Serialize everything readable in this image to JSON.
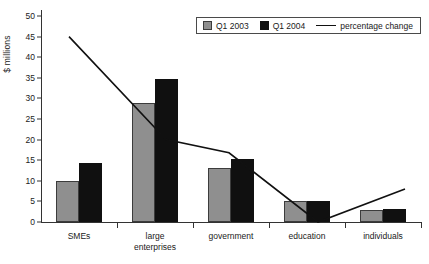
{
  "chart_data": {
    "type": "bar",
    "title": "",
    "xlabel": "",
    "ylabel": "$ millions",
    "ylim": [
      0,
      50
    ],
    "yticks": [
      0,
      5,
      10,
      15,
      20,
      25,
      30,
      35,
      40,
      45,
      50
    ],
    "grid": false,
    "legend_position": "top-right",
    "categories": [
      "SMEs",
      "large\nenterprises",
      "government",
      "education",
      "individuals"
    ],
    "series": [
      {
        "name": "Q1 2003",
        "type": "bar",
        "color": "#8f8f8f",
        "values": [
          9.9,
          28.8,
          13.0,
          5.1,
          2.9
        ]
      },
      {
        "name": "Q1 2004",
        "type": "bar",
        "color": "#101010",
        "values": [
          14.3,
          34.6,
          15.2,
          5.1,
          3.2
        ]
      },
      {
        "name": "percentage change",
        "type": "line",
        "color": "#111111",
        "values": [
          45.0,
          20.0,
          16.8,
          0.0,
          8.0
        ]
      }
    ],
    "legend": [
      "Q1 2003",
      "Q1 2004",
      "percentage change"
    ]
  },
  "axis": {
    "y_title": "$ millions",
    "tick_labels": [
      "0",
      "5",
      "10",
      "15",
      "20",
      "25",
      "30",
      "35",
      "40",
      "45",
      "50"
    ]
  },
  "legend": {
    "q1_2003": "Q1 2003",
    "q1_2004": "Q1 2004",
    "pct_change": "percentage change"
  },
  "categories": {
    "c0": "SMEs",
    "c1": "large\nenterprises",
    "c2": "government",
    "c3": "education",
    "c4": "individuals"
  }
}
